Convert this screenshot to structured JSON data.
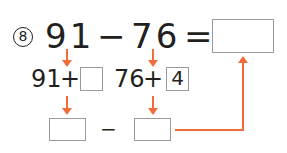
{
  "problem": {
    "number_badge": "8",
    "expression": {
      "minuend": "91",
      "operator": "−",
      "subtrahend": "76",
      "equals": "="
    },
    "answer_value": ""
  },
  "step1": {
    "left": {
      "base": "91",
      "operator": "+",
      "addend_value": ""
    },
    "right": {
      "base": "76",
      "operator": "+",
      "addend_value": "4"
    }
  },
  "step2": {
    "left_value": "",
    "operator": "−",
    "right_value": ""
  },
  "colors": {
    "arrow": "#f26b3a",
    "text": "#231f20",
    "box_border": "#9a9a9a"
  }
}
